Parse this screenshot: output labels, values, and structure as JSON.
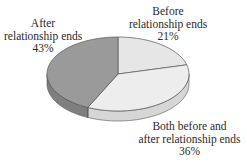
{
  "chart_data": {
    "type": "pie",
    "style": "3d",
    "title": "",
    "slices": [
      {
        "label": "Before relationship ends",
        "value": 21,
        "display": "21%",
        "color": "#e6e6e6"
      },
      {
        "label": "Both before and after relationship ends",
        "value": 36,
        "display": "36%",
        "color": "#ededed"
      },
      {
        "label": "After relationship ends",
        "value": 43,
        "display": "43%",
        "color": "#9a9a9a"
      }
    ],
    "start_angle": "12 o'clock",
    "direction": "clockwise",
    "legend": "none (direct labels)"
  },
  "labels": {
    "after": {
      "line1": "After",
      "line2": "relationship ends",
      "pct": "43%"
    },
    "before": {
      "line1": "Before",
      "line2": "relationship ends",
      "pct": "21%"
    },
    "both": {
      "line1": "Both before and",
      "line2": "after relationship ends",
      "pct": "36%"
    }
  }
}
